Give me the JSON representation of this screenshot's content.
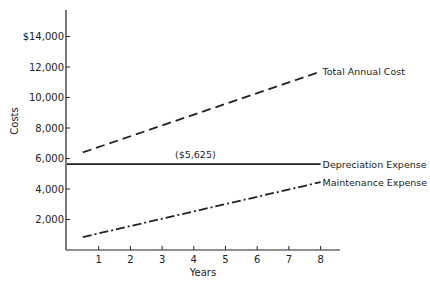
{
  "chart_data": {
    "type": "line",
    "title": "",
    "xlabel": "Years",
    "ylabel": "Costs",
    "xlim": [
      0,
      8.6
    ],
    "ylim": [
      0,
      15000
    ],
    "x_ticks": [
      1,
      2,
      3,
      4,
      5,
      6,
      7,
      8
    ],
    "x_tick_labels": [
      "1",
      "2",
      "3",
      "4",
      "5",
      "6",
      "7",
      "8"
    ],
    "y_ticks": [
      2000,
      4000,
      6000,
      8000,
      10000,
      12000,
      14000
    ],
    "y_tick_labels": [
      "2,000",
      "4,000",
      "6,000",
      "8,000",
      "10,000",
      "12,000",
      "$14,000"
    ],
    "grid": false,
    "legend": "inline labels at right end of each line",
    "series": [
      {
        "name": "Total Annual Cost",
        "style": "dashed",
        "x": [
          0.5,
          8
        ],
        "values": [
          6400,
          11700
        ]
      },
      {
        "name": "Depreciation Expense",
        "style": "solid",
        "x": [
          0,
          8
        ],
        "values": [
          5625,
          5625
        ],
        "annotation": "($5,625)"
      },
      {
        "name": "Maintenance Expense",
        "style": "dash-dot",
        "x": [
          0.5,
          8
        ],
        "values": [
          850,
          4450
        ]
      }
    ]
  }
}
